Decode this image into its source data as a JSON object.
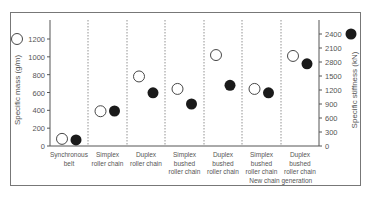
{
  "chart_data": {
    "type": "scatter",
    "title": "",
    "xlabel": "",
    "ylabel": "Specific mass (g/m)",
    "ylabel_right": "Specific stiffness (kN)",
    "ylim": [
      0,
      1200
    ],
    "ylim_right": [
      0,
      2400
    ],
    "left_ticks": [
      "0",
      "200",
      "400",
      "600",
      "800",
      "1000",
      "1200"
    ],
    "right_ticks": [
      "0",
      "300",
      "600",
      "900",
      "1200",
      "1500",
      "2800",
      "2100",
      "2400"
    ],
    "categories": [
      [
        "Synchronous",
        "belt"
      ],
      [
        "Simplex",
        "roller chain"
      ],
      [
        "Duplex",
        "roller chain"
      ],
      [
        "Simplex",
        "bushed",
        "roller chain"
      ],
      [
        "Duplex",
        "bushed",
        "roller chain"
      ],
      [
        "Simplex",
        "bushed",
        "roller chain"
      ],
      [
        "Duplex",
        "bushed",
        "roller chain"
      ]
    ],
    "group_annotation": "New chain generation",
    "series": [
      {
        "name": "Specific mass (g/m)",
        "marker": "open-circle",
        "axis": "left",
        "values": [
          80,
          390,
          780,
          640,
          1020,
          640,
          1010
        ]
      },
      {
        "name": "Specific stiffness (kN)",
        "marker": "filled-circle",
        "axis": "right",
        "values": [
          130,
          750,
          1140,
          900,
          1300,
          1140,
          1760
        ]
      }
    ],
    "legend": [
      {
        "marker": "open-circle",
        "position": "left-axis-top",
        "refers_to": "Specific mass (g/m)"
      },
      {
        "marker": "filled-circle",
        "position": "right-axis-top",
        "refers_to": "Specific stiffness (kN)"
      }
    ],
    "grid": false,
    "category_separators": "dashed-vertical"
  }
}
